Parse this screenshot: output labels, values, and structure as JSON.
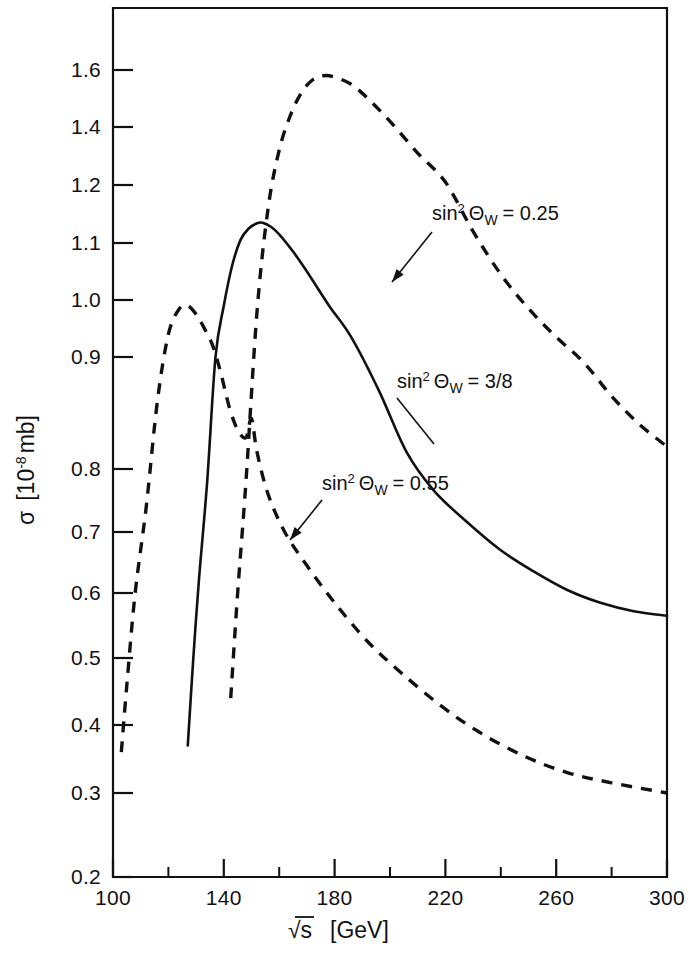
{
  "figure": {
    "background": "#ffffff",
    "ink": "#111111"
  },
  "axes": {
    "x": {
      "label_parts": {
        "sqrt": "√s",
        "unit": "[GeV]"
      },
      "label": "√s  [GeV]",
      "ticks": [
        100,
        140,
        180,
        220,
        260,
        300
      ],
      "tick_labels": [
        "100",
        "140",
        "180",
        "220",
        "260",
        "300"
      ],
      "minor_ticks": [
        120,
        160,
        200,
        240,
        280
      ],
      "min": 100,
      "max": 300
    },
    "y": {
      "label": "σ [10⁻⁸ mb]",
      "label_parts": {
        "symbol": "σ",
        "open": "[",
        "mantissa": "10",
        "exponent": "-8",
        "unit": "mb",
        "close": "]"
      },
      "ticks": [
        0.2,
        0.3,
        0.4,
        0.5,
        0.6,
        0.7,
        0.8,
        0.9,
        1.0,
        1.1,
        1.2,
        1.4,
        1.6
      ],
      "tick_labels": [
        "0.2",
        "0.3",
        "0.4",
        "0.5",
        "0.6",
        "0.7",
        "0.8",
        "0.9",
        "1.0",
        "1.1",
        "1.2",
        "1.4",
        "1.6"
      ],
      "min": 0.2,
      "max": 1.72,
      "scale": "nonlinear-compressed"
    }
  },
  "annotations": [
    {
      "id": "ann-025",
      "text": "sin² Θ_W = 0.25",
      "parts": {
        "sin": "sin",
        "sup": "2",
        "theta": "Θ",
        "sub": "W",
        "eq": "= 0.25"
      },
      "text_x": 432,
      "text_y": 220,
      "leader": [
        [
          432,
          232
        ],
        [
          392,
          282
        ]
      ],
      "arrow": true,
      "target_curve": "sin2thetaW_0.25"
    },
    {
      "id": "ann-38",
      "text": "sin² Θ_W = 3/8",
      "parts": {
        "sin": "sin",
        "sup": "2",
        "theta": "Θ",
        "sub": "W",
        "eq": "= 3/8"
      },
      "text_x": 397,
      "text_y": 388,
      "leader": [
        [
          397,
          398
        ],
        [
          434,
          444
        ]
      ],
      "arrow": false,
      "target_curve": "sin2thetaW_3/8"
    },
    {
      "id": "ann-055",
      "text": "sin² Θ_W = 0.55",
      "parts": {
        "sin": "sin",
        "sup": "2",
        "theta": "Θ",
        "sub": "W",
        "eq": "= 0.55"
      },
      "text_x": 322,
      "text_y": 490,
      "leader": [
        [
          322,
          500
        ],
        [
          290,
          540
        ]
      ],
      "arrow": true,
      "target_curve": "sin2thetaW_0.55"
    }
  ],
  "chart_data": {
    "type": "line",
    "title": "",
    "xlabel": "√s  [GeV]",
    "ylabel": "σ [10⁻⁸ mb]",
    "xlim": [
      100,
      300
    ],
    "ylim": [
      0.2,
      1.72
    ],
    "grid": false,
    "legend_position": "inline-annotations",
    "series": [
      {
        "name": "sin2thetaW_0.25",
        "label": "sin² Θ_W = 0.25",
        "style": "dashed",
        "x": [
          142.5,
          145,
          148,
          152,
          156,
          160,
          164,
          168,
          172,
          176,
          180,
          186,
          192,
          200,
          210,
          220,
          230,
          240,
          250,
          260,
          270,
          280,
          290,
          300
        ],
        "y": [
          0.44,
          0.6,
          0.78,
          0.98,
          1.16,
          1.32,
          1.44,
          1.52,
          1.565,
          1.58,
          1.575,
          1.55,
          1.5,
          1.42,
          1.31,
          1.21,
          1.12,
          1.045,
          0.985,
          0.935,
          0.895,
          0.865,
          0.84,
          0.82
        ]
      },
      {
        "name": "sin2thetaW_3/8",
        "label": "sin² Θ_W = 3/8",
        "style": "solid",
        "x": [
          127,
          129,
          131,
          134,
          137,
          140,
          143,
          146,
          149,
          152,
          154,
          157,
          160,
          165,
          170,
          178,
          186,
          196,
          206,
          216,
          228,
          240,
          252,
          264,
          276,
          288,
          300
        ],
        "y": [
          0.37,
          0.5,
          0.62,
          0.78,
          0.9,
          0.99,
          1.06,
          1.105,
          1.125,
          1.134,
          1.135,
          1.128,
          1.115,
          1.085,
          1.05,
          0.99,
          0.935,
          0.87,
          0.815,
          0.765,
          0.715,
          0.67,
          0.635,
          0.605,
          0.585,
          0.572,
          0.565
        ]
      },
      {
        "name": "sin2thetaW_0.55",
        "label": "sin² Θ_W = 0.55",
        "style": "dashed",
        "x": [
          103,
          105,
          108,
          112,
          116,
          120,
          124,
          127,
          130,
          133,
          136,
          139,
          142,
          145,
          148,
          150,
          152,
          156,
          162,
          170,
          180,
          192,
          204,
          218,
          232,
          248,
          264,
          280,
          300
        ],
        "y": [
          0.36,
          0.46,
          0.6,
          0.74,
          0.86,
          0.94,
          0.985,
          0.99,
          0.975,
          0.95,
          0.92,
          0.885,
          0.855,
          0.835,
          0.828,
          0.845,
          0.815,
          0.76,
          0.7,
          0.645,
          0.585,
          0.525,
          0.478,
          0.43,
          0.39,
          0.355,
          0.33,
          0.315,
          0.3
        ]
      }
    ]
  }
}
